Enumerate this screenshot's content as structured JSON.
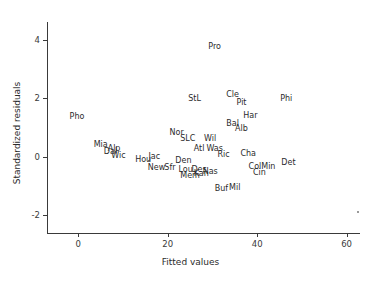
{
  "chart_data": {
    "type": "scatter",
    "title": "",
    "xlabel": "Fitted values",
    "ylabel": "Standardized residuals",
    "xlim": [
      -7,
      63
    ],
    "ylim": [
      -2.6,
      4.6
    ],
    "xticks": [
      0,
      20,
      40,
      60
    ],
    "yticks": [
      4,
      2,
      0,
      -2
    ],
    "xticklabels": [
      "0",
      "20",
      "40",
      "60"
    ],
    "yticklabels": [
      "4",
      "2",
      "0",
      "-2"
    ],
    "grid": false,
    "legend": false,
    "marker_style": "text-label",
    "points": [
      {
        "label": "Pho",
        "x": -0.3,
        "y": 1.35
      },
      {
        "label": "Pro",
        "x": 30.5,
        "y": 3.75
      },
      {
        "label": "StL",
        "x": 26.0,
        "y": 1.98
      },
      {
        "label": "Cle",
        "x": 34.5,
        "y": 2.12
      },
      {
        "label": "Pit",
        "x": 36.5,
        "y": 1.82
      },
      {
        "label": "Phi",
        "x": 46.5,
        "y": 1.98
      },
      {
        "label": "Har",
        "x": 38.5,
        "y": 1.38
      },
      {
        "label": "Bal",
        "x": 34.5,
        "y": 1.12
      },
      {
        "label": "Alb",
        "x": 36.5,
        "y": 0.95
      },
      {
        "label": "Nor",
        "x": 22.0,
        "y": 0.8
      },
      {
        "label": "SLC",
        "x": 24.5,
        "y": 0.6
      },
      {
        "label": "Wil",
        "x": 29.5,
        "y": 0.62
      },
      {
        "label": "Mia",
        "x": 5.0,
        "y": 0.4
      },
      {
        "label": "Alp",
        "x": 8.0,
        "y": 0.26
      },
      {
        "label": "Dal",
        "x": 7.2,
        "y": 0.16
      },
      {
        "label": "Wic",
        "x": 9.0,
        "y": 0.02
      },
      {
        "label": "Hou",
        "x": 14.5,
        "y": -0.12
      },
      {
        "label": "Jac",
        "x": 17.0,
        "y": 0.0
      },
      {
        "label": "Atl",
        "x": 27.0,
        "y": 0.26
      },
      {
        "label": "Was",
        "x": 30.5,
        "y": 0.26
      },
      {
        "label": "Ric",
        "x": 32.5,
        "y": 0.06
      },
      {
        "label": "Cha",
        "x": 38.0,
        "y": 0.1
      },
      {
        "label": "Den",
        "x": 23.5,
        "y": -0.14
      },
      {
        "label": "New",
        "x": 17.5,
        "y": -0.38
      },
      {
        "label": "Sfr",
        "x": 20.5,
        "y": -0.38
      },
      {
        "label": "Lou",
        "x": 24.0,
        "y": -0.46
      },
      {
        "label": "Des",
        "x": 27.0,
        "y": -0.46
      },
      {
        "label": "Nas",
        "x": 29.5,
        "y": -0.52
      },
      {
        "label": "Kan",
        "x": 27.5,
        "y": -0.58
      },
      {
        "label": "Mem",
        "x": 25.0,
        "y": -0.66
      },
      {
        "label": "Col",
        "x": 39.5,
        "y": -0.34
      },
      {
        "label": "Min",
        "x": 42.5,
        "y": -0.34
      },
      {
        "label": "Det",
        "x": 47.0,
        "y": -0.22
      },
      {
        "label": "Cin",
        "x": 40.5,
        "y": -0.56
      },
      {
        "label": "Buf",
        "x": 32.0,
        "y": -1.1
      },
      {
        "label": "Mil",
        "x": 35.0,
        "y": -1.06
      }
    ]
  }
}
